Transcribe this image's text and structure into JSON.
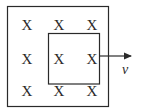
{
  "diagram": {
    "field_symbol": "X",
    "field_grid": {
      "rows": 3,
      "cols": 3,
      "marks": [
        [
          "X",
          "X",
          "X"
        ],
        [
          "X",
          "X",
          "X"
        ],
        [
          "X",
          "X",
          "X"
        ]
      ]
    },
    "velocity_label": "v",
    "colors": {
      "line": "#2a2a2a",
      "background": "#ffffff"
    }
  }
}
